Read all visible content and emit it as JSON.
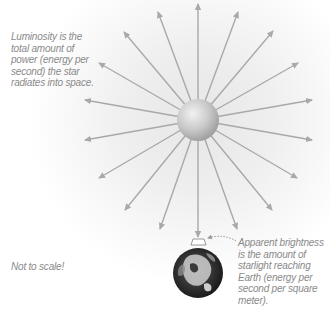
{
  "diagram": {
    "captions": {
      "luminosity": "Luminosity is the total amount of power (energy per second) the star radiates into space.",
      "apparent_brightness": "Apparent brightness is the amount of starlight reaching Earth (energy per second per square meter).",
      "scale_note": "Not to scale!"
    },
    "star": {
      "label": "star",
      "center": [
        198,
        120
      ],
      "radius": 21
    },
    "earth": {
      "label": "Earth",
      "center": [
        198,
        273
      ],
      "radius": 25
    },
    "rays": {
      "count": 16,
      "tips": [
        [
          198,
          4
        ],
        [
          238,
          12
        ],
        [
          273,
          31
        ],
        [
          298,
          63
        ],
        [
          312,
          100
        ],
        [
          312,
          140
        ],
        [
          297,
          178
        ],
        [
          272,
          210
        ],
        [
          237,
          229
        ],
        [
          198,
          237
        ],
        [
          160,
          229
        ],
        [
          125,
          210
        ],
        [
          99,
          178
        ],
        [
          85,
          140
        ],
        [
          85,
          100
        ],
        [
          99,
          63
        ],
        [
          124,
          32
        ],
        [
          158,
          12
        ]
      ]
    },
    "colors": {
      "ray": "#a9a9a9",
      "caption_text": "#8a8a8a",
      "star_light": "#e4e4e4",
      "star_dark": "#9a9a9a",
      "earth_dark": "#1e1e1e",
      "earth_light": "#bdbdbd"
    },
    "icons": {
      "star": "star-sphere-icon",
      "earth": "earth-globe-icon",
      "square_meter_patch": "area-patch-icon",
      "pointer": "dotted-arrow-icon"
    }
  }
}
